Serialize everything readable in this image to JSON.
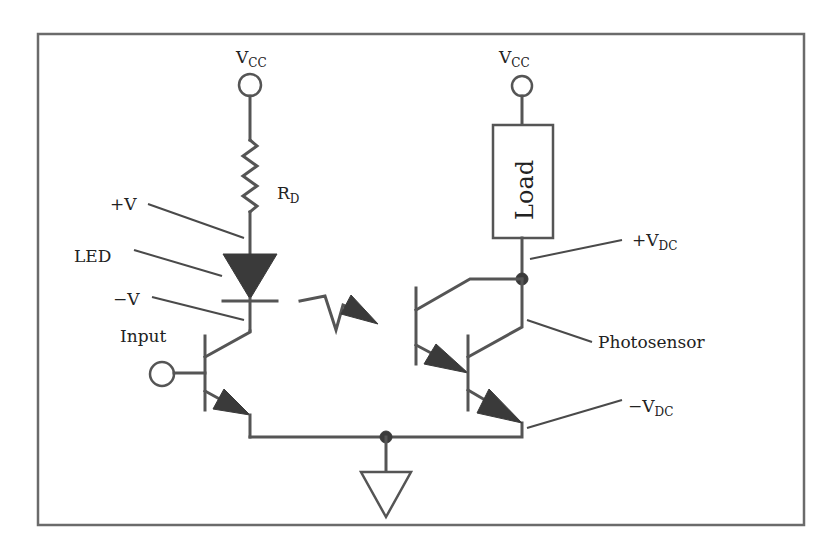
{
  "diagram": {
    "colors": {
      "wire": "#555555",
      "fill": "#3a3a3a",
      "frame": "#6b6b6b",
      "text": "#222222"
    },
    "labels": {
      "vcc_left_main": "V",
      "vcc_left_sub": "CC",
      "vcc_right_main": "V",
      "vcc_right_sub": "CC",
      "rd_main": "R",
      "rd_sub": "D",
      "plus_v": "+V",
      "led": "LED",
      "minus_v": "−V",
      "input": "Input",
      "load": "Load",
      "plus_vdc_main": "+V",
      "plus_vdc_sub": "DC",
      "photosensor": "Photosensor",
      "minus_vdc_main": "−V",
      "minus_vdc_sub": "DC"
    },
    "components": [
      {
        "id": "vcc-left",
        "type": "terminal"
      },
      {
        "id": "resistor-rd",
        "type": "resistor"
      },
      {
        "id": "led",
        "type": "diode"
      },
      {
        "id": "input-transistor",
        "type": "npn-transistor"
      },
      {
        "id": "light-emission",
        "type": "light-arrow"
      },
      {
        "id": "vcc-right",
        "type": "terminal"
      },
      {
        "id": "load",
        "type": "box"
      },
      {
        "id": "photosensor",
        "type": "darlington-phototransistor"
      },
      {
        "id": "ground",
        "type": "ground"
      }
    ]
  }
}
